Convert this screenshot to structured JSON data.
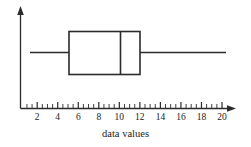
{
  "figure": {
    "caption": "data values",
    "background_color": "#ffffff",
    "line_color": "#2b2b2b"
  },
  "axis": {
    "x_label": "data values",
    "tick_labels": [
      "2",
      "4",
      "6",
      "8",
      "10",
      "12",
      "14",
      "16",
      "18",
      "20"
    ],
    "tick_values": [
      2,
      4,
      6,
      8,
      10,
      12,
      14,
      16,
      18,
      20
    ],
    "minor_tick_step": 0.5,
    "x_axis_arrow": "right-arrow",
    "y_axis_arrow": "up-arrow"
  },
  "chart_data": {
    "type": "boxplot",
    "orientation": "horizontal",
    "title": "",
    "xlabel": "data values",
    "ylabel": "",
    "xlim": [
      1,
      21
    ],
    "grid": false,
    "legend": null,
    "categories": [
      "data values"
    ],
    "series": [
      {
        "name": "data values",
        "min": 1.3,
        "q1": 5,
        "median": 10,
        "q3": 12,
        "max": 20,
        "outliers": []
      }
    ],
    "annotations": []
  }
}
